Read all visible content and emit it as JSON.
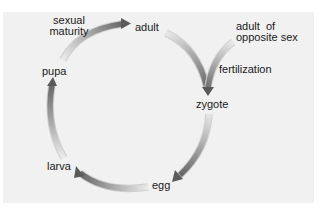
{
  "diagram": {
    "type": "life-cycle",
    "colors": {
      "background_panel": "#f1f1f1",
      "page_background": "#ffffff",
      "arrow_dark": "#5e5e5e",
      "arrow_light": "#e6e6e6",
      "label_text": "#1a1a1a"
    },
    "stages": {
      "adult": "adult",
      "zygote": "zygote",
      "egg": "egg",
      "larva": "larva",
      "pupa": "pupa"
    },
    "transitions": {
      "sexual_maturity_line1": "sexual",
      "sexual_maturity_line2": "maturity",
      "fertilization": "fertilization"
    },
    "external_input": {
      "line1": "adult  of",
      "line2": "opposite sex"
    },
    "cycle": [
      {
        "from": "adult",
        "to": "zygote",
        "label": "fertilization"
      },
      {
        "from": "adult of opposite sex",
        "to": "zygote",
        "label": "fertilization"
      },
      {
        "from": "zygote",
        "to": "egg",
        "label": ""
      },
      {
        "from": "egg",
        "to": "larva",
        "label": ""
      },
      {
        "from": "larva",
        "to": "pupa",
        "label": ""
      },
      {
        "from": "pupa",
        "to": "adult",
        "label": "sexual maturity"
      }
    ]
  }
}
